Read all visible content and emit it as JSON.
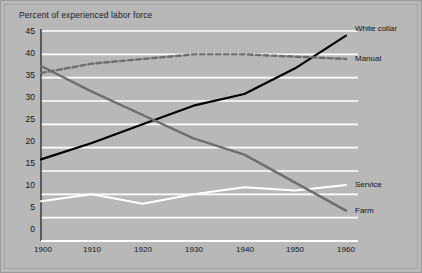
{
  "chart_data": {
    "type": "line",
    "title": "Percent of experienced labor force",
    "xlabel": "",
    "ylabel": "",
    "x": [
      1900,
      1910,
      1920,
      1930,
      1940,
      1950,
      1960
    ],
    "xticklabels": [
      "1900",
      "1910",
      "1920",
      "1930",
      "1940",
      "1950",
      "1960"
    ],
    "yticks": [
      0,
      5,
      10,
      15,
      20,
      25,
      30,
      35,
      40,
      45
    ],
    "yticklabels": [
      "0",
      "5",
      "10",
      "15",
      "20",
      "25",
      "30",
      "35",
      "40",
      "45"
    ],
    "xlim": [
      1900,
      1960
    ],
    "ylim": [
      0,
      45
    ],
    "grid": "horizontal-white",
    "legend_position": "right-inline-labels",
    "background_color": "#b8b8b8",
    "gridline_color": "#ffffff",
    "series": [
      {
        "name": "White collar",
        "values": [
          17.5,
          21.0,
          25.0,
          29.0,
          31.5,
          37.0,
          44.0
        ],
        "color": "#000000",
        "style": "solid",
        "label_y": 44.0
      },
      {
        "name": "Manual",
        "values": [
          36.0,
          38.0,
          39.0,
          40.0,
          40.0,
          39.5,
          39.0
        ],
        "color": "#6e6e6e",
        "style": "dashed",
        "label_y": 39.0
      },
      {
        "name": "Service",
        "values": [
          8.5,
          10.0,
          8.0,
          10.0,
          11.5,
          10.8,
          12.0
        ],
        "color": "#ffffff",
        "style": "solid",
        "label_y": 12.0
      },
      {
        "name": "Farm",
        "values": [
          37.5,
          32.0,
          27.0,
          22.0,
          18.5,
          12.5,
          6.5
        ],
        "color": "#6e6e6e",
        "style": "solid",
        "label_y": 6.5
      }
    ]
  },
  "labels": {
    "white_collar": "White collar",
    "manual": "Manual",
    "service": "Service",
    "farm": "Farm"
  },
  "yticks": {
    "t0": "0",
    "t1": "5",
    "t2": "10",
    "t3": "15",
    "t4": "20",
    "t5": "25",
    "t6": "30",
    "t7": "35",
    "t8": "40",
    "t9": "45"
  },
  "xticks": {
    "t0": "1900",
    "t1": "1910",
    "t2": "1920",
    "t3": "1930",
    "t4": "1940",
    "t5": "1950",
    "t6": "1960"
  }
}
